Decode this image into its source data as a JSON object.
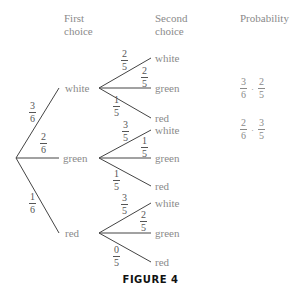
{
  "headers": {
    "first_choice_line1": "First",
    "first_choice_line2": "choice",
    "second_choice_line1": "Second",
    "second_choice_line2": "choice",
    "probability": "Probability"
  },
  "first_choice": [
    {
      "label": "white",
      "prob": {
        "num": "3",
        "den": "6"
      }
    },
    {
      "label": "green",
      "prob": {
        "num": "2",
        "den": "6"
      }
    },
    {
      "label": "red",
      "prob": {
        "num": "1",
        "den": "6"
      }
    }
  ],
  "second_choice": {
    "white": [
      {
        "label": "white",
        "prob": {
          "num": "2",
          "den": "5"
        }
      },
      {
        "label": "green",
        "prob": {
          "num": "2",
          "den": "5"
        }
      },
      {
        "label": "red",
        "prob": {
          "num": "1",
          "den": "5"
        }
      }
    ],
    "green": [
      {
        "label": "white",
        "prob": {
          "num": "3",
          "den": "5"
        }
      },
      {
        "label": "green",
        "prob": {
          "num": "1",
          "den": "5"
        }
      },
      {
        "label": "red",
        "prob": {
          "num": "1",
          "den": "5"
        }
      }
    ],
    "red": [
      {
        "label": "white",
        "prob": {
          "num": "3",
          "den": "5"
        }
      },
      {
        "label": "green",
        "prob": {
          "num": "2",
          "den": "5"
        }
      },
      {
        "label": "red",
        "prob": {
          "num": "0",
          "den": "5"
        }
      }
    ]
  },
  "probabilities": [
    {
      "a_num": "3",
      "a_den": "6",
      "op": "·",
      "b_num": "2",
      "b_den": "5"
    },
    {
      "a_num": "2",
      "a_den": "6",
      "op": "·",
      "b_num": "3",
      "b_den": "5"
    }
  ],
  "caption": "FIGURE 4"
}
